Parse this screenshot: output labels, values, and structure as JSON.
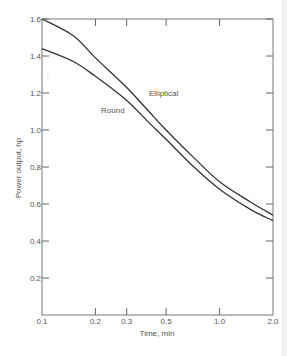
{
  "chart_data": {
    "type": "line",
    "title": "",
    "xlabel": "Time, min",
    "ylabel": "Power output, hp",
    "xscale": "log",
    "xlim": [
      0.1,
      2.0
    ],
    "ylim": [
      0,
      1.6
    ],
    "x_ticks": [
      0.1,
      0.2,
      0.3,
      0.5,
      1.0,
      2.0
    ],
    "x_tick_labels": [
      "0.1",
      "0.2",
      "0.3",
      "0.5",
      "1.0",
      "2.0"
    ],
    "y_ticks": [
      0.2,
      0.4,
      0.6,
      0.8,
      1.0,
      1.2,
      1.4,
      1.6
    ],
    "y_tick_labels": [
      "0.2",
      "0.4",
      "0.6",
      "0.8",
      "1.0",
      "1.2",
      "1.4",
      "1.6"
    ],
    "grid": false,
    "legend": "inline labels",
    "x": [
      0.1,
      0.15,
      0.2,
      0.3,
      0.4,
      0.5,
      0.7,
      1.0,
      1.5,
      2.0
    ],
    "series": [
      {
        "name": "Elliptical",
        "values": [
          1.6,
          1.51,
          1.39,
          1.23,
          1.1,
          1.0,
          0.86,
          0.72,
          0.61,
          0.54
        ]
      },
      {
        "name": "Round",
        "values": [
          1.44,
          1.37,
          1.29,
          1.16,
          1.04,
          0.95,
          0.81,
          0.68,
          0.57,
          0.51
        ]
      }
    ],
    "annotations": [
      {
        "text": "Elliptical",
        "near_x": 0.4,
        "near_y": 1.2
      },
      {
        "text": "Round",
        "near_x": 0.22,
        "near_y": 1.1
      }
    ]
  },
  "colors": {
    "line": "#333333",
    "axis": "#666666",
    "text": "#555555",
    "background": "#ffffff"
  }
}
